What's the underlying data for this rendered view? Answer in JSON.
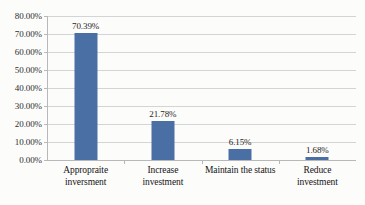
{
  "chart_data": {
    "type": "bar",
    "title": "",
    "subtitle": "",
    "xlabel": "",
    "ylabel": "",
    "categories": [
      "Appropraite inversment",
      "Increase investment",
      "Maintain the status",
      "Reduce investment"
    ],
    "category_lines": [
      [
        "Appropraite",
        "inversment"
      ],
      [
        "Increase",
        "investment"
      ],
      [
        "Maintain the status"
      ],
      [
        "Reduce",
        "investment"
      ]
    ],
    "values": [
      70.39,
      21.78,
      6.15,
      1.68
    ],
    "data_labels": [
      "70.39%",
      "21.78%",
      "6.15%",
      "1.68%"
    ],
    "ylim": [
      0,
      80
    ],
    "ytick_values": [
      0,
      10,
      20,
      30,
      40,
      50,
      60,
      70,
      80
    ],
    "ytick_labels": [
      "0.00%",
      "10.00%",
      "20.00%",
      "30.00%",
      "40.00%",
      "50.00%",
      "60.00%",
      "70.00%",
      "80.00%"
    ],
    "grid": true,
    "legend": false,
    "legend_position": "none",
    "series_color": "#4A6FA5",
    "gridline_color": "#D4D4D4",
    "axis_color": "#B8B8B8",
    "background_color": "#FCFCFB"
  }
}
